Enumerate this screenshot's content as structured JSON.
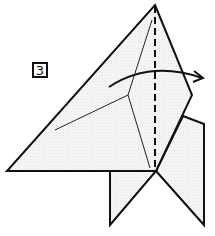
{
  "diagram": {
    "step_number": "3",
    "paper_fill": "#f2f2f2",
    "line_color": "#111111",
    "instruction": "Valley fold along dashed line; fold left portion over to the right (arrow)",
    "elements": {
      "dashed_line": "valley-fold-line",
      "arrow": "fold-direction-arrow",
      "crease_lines": "existing-creases"
    }
  }
}
